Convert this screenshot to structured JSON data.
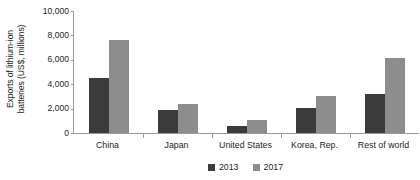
{
  "chart_data": {
    "type": "bar",
    "title": "",
    "xlabel": "",
    "ylabel": "Exports of lithium-ion\nbatteries (US$, millions)",
    "categories": [
      "China",
      "Japan",
      "United States",
      "Korea, Rep.",
      "Rest of world"
    ],
    "series": [
      {
        "name": "2013",
        "color": "#3b3b3b",
        "values": [
          4550,
          1900,
          570,
          2050,
          3200
        ]
      },
      {
        "name": "2017",
        "color": "#8d8d8d",
        "values": [
          7600,
          2400,
          1070,
          3050,
          6150
        ]
      }
    ],
    "ylim": [
      0,
      10000
    ],
    "yticks": [
      0,
      2000,
      4000,
      6000,
      8000,
      10000
    ],
    "ytick_labels": [
      "0",
      "2,000",
      "4,000",
      "6,000",
      "8,000",
      "10,000"
    ],
    "grid": false,
    "legend_position": "bottom-center",
    "axis_color": "#9a9a9a",
    "text_color": "#231f20",
    "background": "#ffffff"
  }
}
